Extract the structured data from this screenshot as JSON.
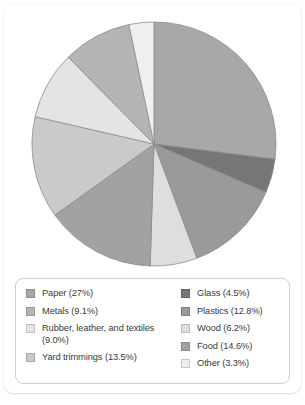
{
  "chart_data": {
    "type": "pie",
    "title": "",
    "subtitle": "",
    "xlabel": "",
    "ylabel": "",
    "grid": false,
    "legend_position": "bottom",
    "units": "percent",
    "start_angle_deg": 0,
    "direction": "clockwise",
    "total": 100.0,
    "categories": [
      "Paper",
      "Glass",
      "Plastics",
      "Wood",
      "Food",
      "Yard trimmings",
      "Rubber, leather, and textiles",
      "Metals",
      "Other"
    ],
    "values": [
      27.0,
      4.5,
      12.8,
      6.2,
      14.6,
      13.5,
      9.0,
      9.1,
      3.3
    ],
    "slices": [
      {
        "label": "Paper",
        "value": 27.0,
        "color": "#a8a8a8"
      },
      {
        "label": "Glass",
        "value": 4.5,
        "color": "#767676"
      },
      {
        "label": "Plastics",
        "value": 12.8,
        "color": "#9a9a9a"
      },
      {
        "label": "Wood",
        "value": 6.2,
        "color": "#dedede"
      },
      {
        "label": "Food",
        "value": 14.6,
        "color": "#a2a2a2"
      },
      {
        "label": "Yard trimmings",
        "value": 13.5,
        "color": "#cacaca"
      },
      {
        "label": "Rubber, leather, and textiles",
        "value": 9.0,
        "color": "#e4e4e4"
      },
      {
        "label": "Metals",
        "value": 9.1,
        "color": "#b5b5b5"
      },
      {
        "label": "Other",
        "value": 3.3,
        "color": "#efefef"
      }
    ],
    "slice_edge_color": "#8c8c8c"
  },
  "legend": {
    "left_column": [
      {
        "label": "Paper (27%)",
        "color": "#a8a8a8"
      },
      {
        "label": "Metals (9.1%)",
        "color": "#b5b5b5"
      },
      {
        "label": "Rubber, leather, and textiles\n(9.0%)",
        "color": "#e4e4e4"
      },
      {
        "label": "Yard trimmings (13.5%)",
        "color": "#cacaca"
      }
    ],
    "right_column": [
      {
        "label": "Glass (4.5%)",
        "color": "#767676"
      },
      {
        "label": "Plastics (12.8%)",
        "color": "#9a9a9a"
      },
      {
        "label": "Wood (6.2%)",
        "color": "#dedede"
      },
      {
        "label": "Food (14.6%)",
        "color": "#a2a2a2"
      },
      {
        "label": "Other (3.3%)",
        "color": "#efefef"
      }
    ]
  },
  "style": {
    "card_background": "#ffffff",
    "legend_border": "#cfcfcf",
    "text_color": "#3a3a3a"
  }
}
